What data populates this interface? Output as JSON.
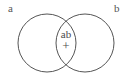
{
  "figure": {
    "background_color": "#ffffff",
    "stroke_color": "#555555",
    "stroke_width": 1,
    "text_color": "#4a4a4a"
  },
  "sets": [
    {
      "id": "a",
      "label": "a",
      "label_position": "top-left",
      "cx": 47,
      "cy": 43,
      "r": 29
    },
    {
      "id": "b",
      "label": "b",
      "label_position": "top-right",
      "cx": 85,
      "cy": 43,
      "r": 29
    }
  ],
  "intersection": {
    "label": "ab",
    "symbol": "+",
    "cx": 66,
    "cy": 43
  }
}
